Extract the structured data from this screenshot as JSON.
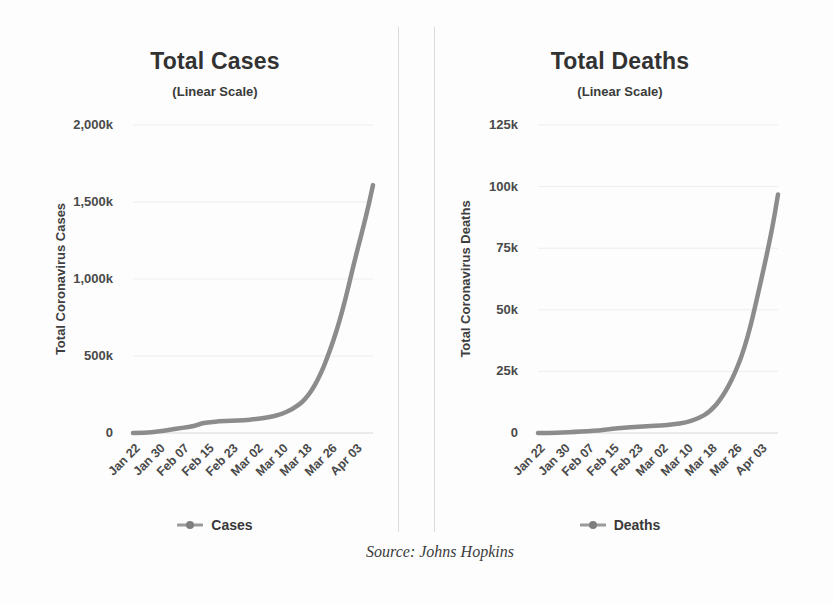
{
  "page": {
    "background": "#fdfdfd",
    "source_caption": "Source: Johns Hopkins"
  },
  "chart_data": [
    {
      "type": "line",
      "title": "Total Cases",
      "subtitle": "(Linear Scale)",
      "y_axis_title": "Total Coronavirus Cases",
      "legend_label": "Cases",
      "legend_position": "bottom",
      "grid": true,
      "line_color": "#8c8c8c",
      "x_range_days": [
        0,
        78
      ],
      "ylim": [
        0,
        2000000
      ],
      "y_ticks": [
        {
          "value": 2000000,
          "label": "2,000k"
        },
        {
          "value": 1500000,
          "label": "1,500k"
        },
        {
          "value": 1000000,
          "label": "1,000k"
        },
        {
          "value": 500000,
          "label": "500k"
        },
        {
          "value": 0,
          "label": "0"
        }
      ],
      "x_ticks": [
        {
          "day": 0,
          "label": "Jan 22"
        },
        {
          "day": 8,
          "label": "Jan 30"
        },
        {
          "day": 16,
          "label": "Feb 07"
        },
        {
          "day": 24,
          "label": "Feb 15"
        },
        {
          "day": 32,
          "label": "Feb 23"
        },
        {
          "day": 40,
          "label": "Mar 02"
        },
        {
          "day": 48,
          "label": "Mar 10"
        },
        {
          "day": 56,
          "label": "Mar 18"
        },
        {
          "day": 64,
          "label": "Mar 26"
        },
        {
          "day": 72,
          "label": "Apr 03"
        }
      ],
      "points": [
        {
          "day": 0,
          "date": "Jan 22",
          "value": 555
        },
        {
          "day": 4,
          "date": "Jan 26",
          "value": 2118
        },
        {
          "day": 8,
          "date": "Jan 30",
          "value": 8234
        },
        {
          "day": 12,
          "date": "Feb 03",
          "value": 19881
        },
        {
          "day": 16,
          "date": "Feb 07",
          "value": 34391
        },
        {
          "day": 20,
          "date": "Feb 11",
          "value": 44759
        },
        {
          "day": 22,
          "date": "Feb 13",
          "value": 60328
        },
        {
          "day": 24,
          "date": "Feb 15",
          "value": 69030
        },
        {
          "day": 28,
          "date": "Feb 19",
          "value": 75641
        },
        {
          "day": 32,
          "date": "Feb 23",
          "value": 78985
        },
        {
          "day": 36,
          "date": "Feb 27",
          "value": 82746
        },
        {
          "day": 40,
          "date": "Mar 02",
          "value": 90306
        },
        {
          "day": 44,
          "date": "Mar 06",
          "value": 101801
        },
        {
          "day": 48,
          "date": "Mar 10",
          "value": 118592
        },
        {
          "day": 52,
          "date": "Mar 14",
          "value": 156101
        },
        {
          "day": 56,
          "date": "Mar 18",
          "value": 214910
        },
        {
          "day": 60,
          "date": "Mar 22",
          "value": 336953
        },
        {
          "day": 64,
          "date": "Mar 26",
          "value": 529591
        },
        {
          "day": 68,
          "date": "Mar 30",
          "value": 782365
        },
        {
          "day": 72,
          "date": "Apr 03",
          "value": 1117872
        },
        {
          "day": 76,
          "date": "Apr 07",
          "value": 1426096
        },
        {
          "day": 78,
          "date": "Apr 09",
          "value": 1610000
        }
      ]
    },
    {
      "type": "line",
      "title": "Total Deaths",
      "subtitle": "(Linear Scale)",
      "y_axis_title": "Total Coronavirus Deaths",
      "legend_label": "Deaths",
      "legend_position": "bottom",
      "grid": true,
      "line_color": "#8c8c8c",
      "x_range_days": [
        0,
        78
      ],
      "ylim": [
        0,
        125000
      ],
      "y_ticks": [
        {
          "value": 125000,
          "label": "125k"
        },
        {
          "value": 100000,
          "label": "100k"
        },
        {
          "value": 75000,
          "label": "75k"
        },
        {
          "value": 50000,
          "label": "50k"
        },
        {
          "value": 25000,
          "label": "25k"
        },
        {
          "value": 0,
          "label": "0"
        }
      ],
      "x_ticks": [
        {
          "day": 0,
          "label": "Jan 22"
        },
        {
          "day": 8,
          "label": "Jan 30"
        },
        {
          "day": 16,
          "label": "Feb 07"
        },
        {
          "day": 24,
          "label": "Feb 15"
        },
        {
          "day": 32,
          "label": "Feb 23"
        },
        {
          "day": 40,
          "label": "Mar 02"
        },
        {
          "day": 48,
          "label": "Mar 10"
        },
        {
          "day": 56,
          "label": "Mar 18"
        },
        {
          "day": 64,
          "label": "Mar 26"
        },
        {
          "day": 72,
          "label": "Apr 03"
        }
      ],
      "points": [
        {
          "day": 0,
          "date": "Jan 22",
          "value": 17
        },
        {
          "day": 4,
          "date": "Jan 26",
          "value": 56
        },
        {
          "day": 8,
          "date": "Jan 30",
          "value": 171
        },
        {
          "day": 12,
          "date": "Feb 03",
          "value": 426
        },
        {
          "day": 16,
          "date": "Feb 07",
          "value": 719
        },
        {
          "day": 20,
          "date": "Feb 11",
          "value": 1113
        },
        {
          "day": 22,
          "date": "Feb 13",
          "value": 1369
        },
        {
          "day": 24,
          "date": "Feb 15",
          "value": 1669
        },
        {
          "day": 28,
          "date": "Feb 19",
          "value": 2122
        },
        {
          "day": 32,
          "date": "Feb 23",
          "value": 2469
        },
        {
          "day": 36,
          "date": "Feb 27",
          "value": 2814
        },
        {
          "day": 40,
          "date": "Mar 02",
          "value": 3085
        },
        {
          "day": 44,
          "date": "Mar 06",
          "value": 3460
        },
        {
          "day": 48,
          "date": "Mar 10",
          "value": 4262
        },
        {
          "day": 52,
          "date": "Mar 14",
          "value": 5819
        },
        {
          "day": 56,
          "date": "Mar 18",
          "value": 8733
        },
        {
          "day": 60,
          "date": "Mar 22",
          "value": 14651
        },
        {
          "day": 64,
          "date": "Mar 26",
          "value": 23970
        },
        {
          "day": 68,
          "date": "Mar 30",
          "value": 37582
        },
        {
          "day": 72,
          "date": "Apr 03",
          "value": 58929
        },
        {
          "day": 76,
          "date": "Apr 07",
          "value": 81865
        },
        {
          "day": 78,
          "date": "Apr 09",
          "value": 96800
        }
      ]
    }
  ]
}
